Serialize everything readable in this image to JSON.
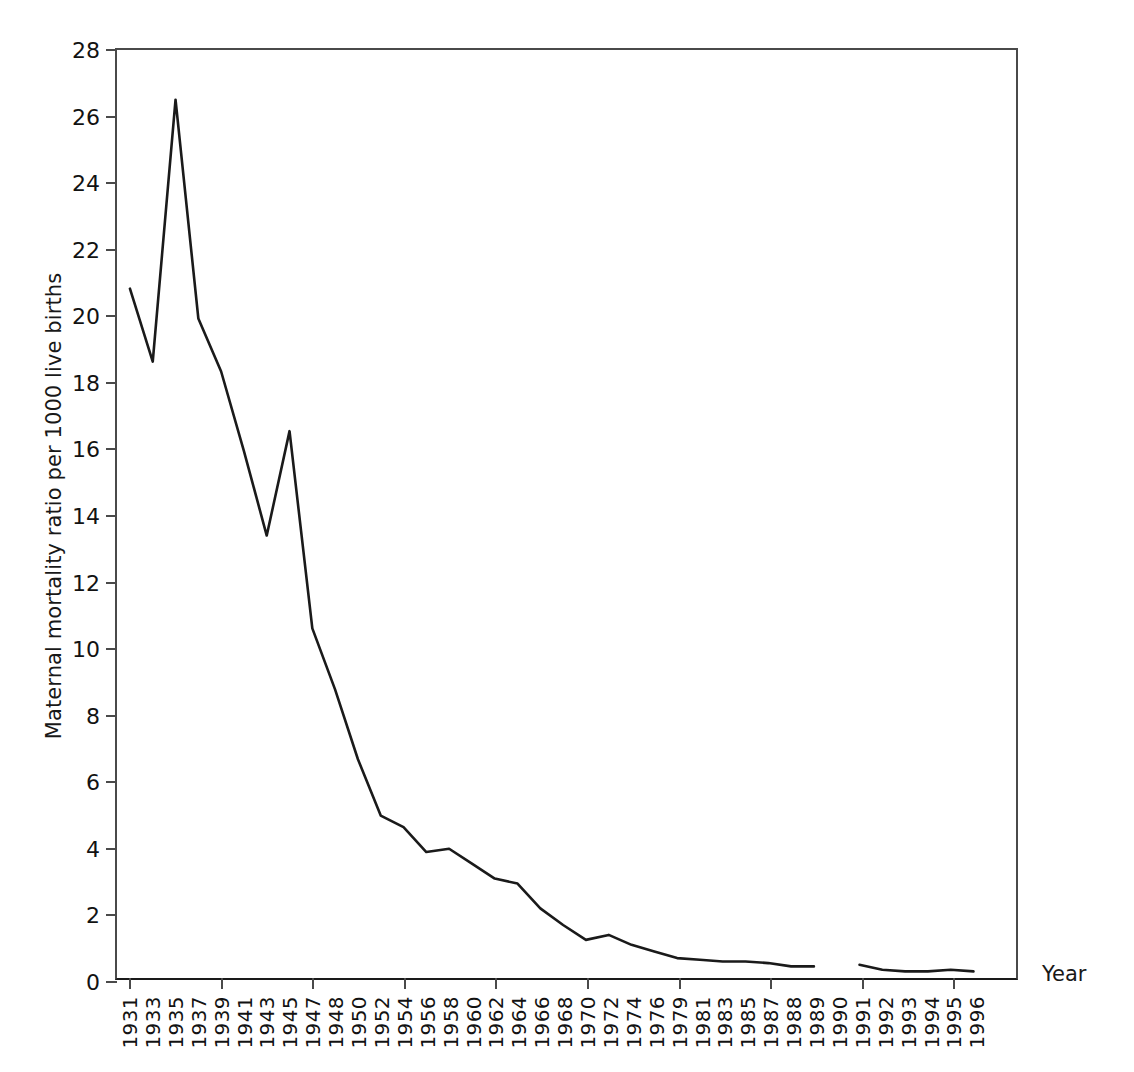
{
  "chart_data": {
    "type": "line",
    "title": "",
    "xlabel": "Year",
    "ylabel": "Maternal mortality ratio per 1000 live births",
    "ylim": [
      0,
      28
    ],
    "yticks": [
      0,
      2,
      4,
      6,
      8,
      10,
      12,
      14,
      16,
      18,
      20,
      22,
      24,
      26,
      28
    ],
    "grid": false,
    "legend": "none",
    "line_color": "#1a1a1a",
    "categories": [
      "1931",
      "1933",
      "1935",
      "1937",
      "1939",
      "1941",
      "1943",
      "1945",
      "1947",
      "1948",
      "1950",
      "1952",
      "1954",
      "1956",
      "1958",
      "1960",
      "1962",
      "1964",
      "1966",
      "1968",
      "1970",
      "1972",
      "1974",
      "1976",
      "1979",
      "1981",
      "1983",
      "1985",
      "1987",
      "1988",
      "1989",
      "1990",
      "1991",
      "1992",
      "1993",
      "1994",
      "1995",
      "1996"
    ],
    "values": [
      20.8,
      18.6,
      26.5,
      19.9,
      18.3,
      15.9,
      13.35,
      16.5,
      10.55,
      8.7,
      6.6,
      4.9,
      4.55,
      3.8,
      3.9,
      3.45,
      3.0,
      2.85,
      2.1,
      1.6,
      1.15,
      1.3,
      1.0,
      0.8,
      0.6,
      0.55,
      0.5,
      0.5,
      0.45,
      0.35,
      0.35,
      null,
      0.4,
      0.25,
      0.2,
      0.2,
      0.25,
      0.2
    ]
  },
  "caption": ""
}
